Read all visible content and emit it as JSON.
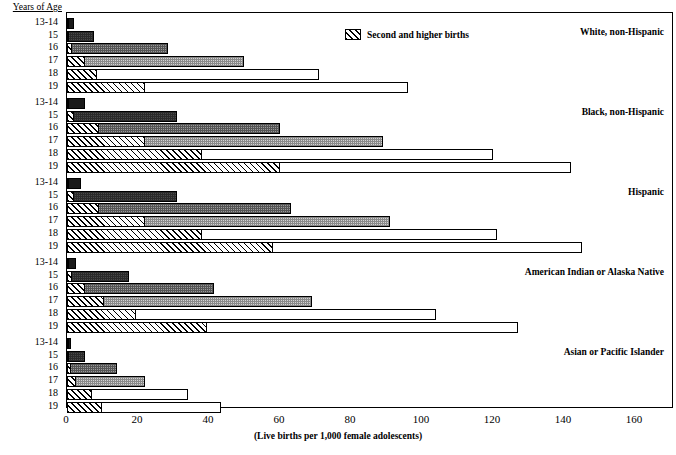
{
  "chart_data": {
    "type": "bar",
    "orientation": "horizontal",
    "title": "",
    "subtitle": "",
    "xlabel": "(Live births per 1,000 female adolescents)",
    "ylabel": "Years of Age",
    "xlim": [
      0,
      171
    ],
    "xticks": [
      0,
      20,
      40,
      60,
      80,
      100,
      120,
      140,
      160
    ],
    "xticklabels": [
      "0",
      "20",
      "40",
      "60",
      "80",
      "100",
      "120",
      "140",
      "160"
    ],
    "grid": false,
    "legend": {
      "position": "top-center",
      "entries": [
        {
          "label": "Second and higher births",
          "pattern": "diagonal-hatch"
        }
      ]
    },
    "categories": [
      "13-14",
      "15",
      "16",
      "17",
      "18",
      "19"
    ],
    "groups": [
      {
        "name": "White, non-Hispanic",
        "rows": [
          {
            "age": "13-14",
            "total": 2.0,
            "second_and_higher": 0.2,
            "fill": "fill-solid"
          },
          {
            "age": "15",
            "total": 7.5,
            "second_and_higher": 0.7,
            "fill": "fill-dark"
          },
          {
            "age": "16",
            "total": 28.5,
            "second_and_higher": 1.5,
            "fill": "fill-mid"
          },
          {
            "age": "17",
            "total": 50.0,
            "second_and_higher": 5.0,
            "fill": "fill-light"
          },
          {
            "age": "18",
            "total": 71.0,
            "second_and_higher": 8.5,
            "fill": "fill-white"
          },
          {
            "age": "19",
            "total": 96.0,
            "second_and_higher": 22.0,
            "fill": "fill-white"
          }
        ]
      },
      {
        "name": "Black, non-Hispanic",
        "rows": [
          {
            "age": "13-14",
            "total": 5.0,
            "second_and_higher": 0.4,
            "fill": "fill-solid"
          },
          {
            "age": "15",
            "total": 31.0,
            "second_and_higher": 2.0,
            "fill": "fill-dark"
          },
          {
            "age": "16",
            "total": 60.0,
            "second_and_higher": 9.0,
            "fill": "fill-mid"
          },
          {
            "age": "17",
            "total": 89.0,
            "second_and_higher": 22.0,
            "fill": "fill-light"
          },
          {
            "age": "18",
            "total": 120.0,
            "second_and_higher": 38.0,
            "fill": "fill-white"
          },
          {
            "age": "19",
            "total": 142.0,
            "second_and_higher": 60.0,
            "fill": "fill-white"
          }
        ]
      },
      {
        "name": "Hispanic",
        "rows": [
          {
            "age": "13-14",
            "total": 4.0,
            "second_and_higher": 0.4,
            "fill": "fill-solid"
          },
          {
            "age": "15",
            "total": 31.0,
            "second_and_higher": 2.0,
            "fill": "fill-dark"
          },
          {
            "age": "16",
            "total": 63.0,
            "second_and_higher": 9.0,
            "fill": "fill-mid"
          },
          {
            "age": "17",
            "total": 91.0,
            "second_and_higher": 22.0,
            "fill": "fill-light"
          },
          {
            "age": "18",
            "total": 121.0,
            "second_and_higher": 38.0,
            "fill": "fill-white"
          },
          {
            "age": "19",
            "total": 145.0,
            "second_and_higher": 58.0,
            "fill": "fill-white"
          }
        ]
      },
      {
        "name": "American Indian or Alaska Native",
        "rows": [
          {
            "age": "13-14",
            "total": 2.5,
            "second_and_higher": 0.3,
            "fill": "fill-solid"
          },
          {
            "age": "15",
            "total": 17.5,
            "second_and_higher": 1.5,
            "fill": "fill-dark"
          },
          {
            "age": "16",
            "total": 41.5,
            "second_and_higher": 5.0,
            "fill": "fill-mid"
          },
          {
            "age": "17",
            "total": 69.0,
            "second_and_higher": 10.5,
            "fill": "fill-light"
          },
          {
            "age": "18",
            "total": 104.0,
            "second_and_higher": 19.5,
            "fill": "fill-white"
          },
          {
            "age": "19",
            "total": 127.0,
            "second_and_higher": 39.5,
            "fill": "fill-white"
          }
        ]
      },
      {
        "name": "Asian or Pacific Islander",
        "rows": [
          {
            "age": "13-14",
            "total": 1.0,
            "second_and_higher": 0.1,
            "fill": "fill-solid"
          },
          {
            "age": "15",
            "total": 5.0,
            "second_and_higher": 0.4,
            "fill": "fill-dark"
          },
          {
            "age": "16",
            "total": 14.0,
            "second_and_higher": 1.0,
            "fill": "fill-mid"
          },
          {
            "age": "17",
            "total": 22.0,
            "second_and_higher": 2.5,
            "fill": "fill-light"
          },
          {
            "age": "18",
            "total": 34.0,
            "second_and_higher": 7.0,
            "fill": "fill-white"
          },
          {
            "age": "19",
            "total": 43.5,
            "second_and_higher": 10.0,
            "fill": "fill-white"
          }
        ]
      }
    ]
  }
}
